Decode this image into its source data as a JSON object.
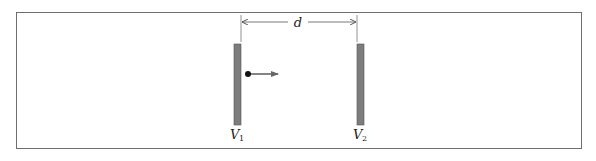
{
  "figure": {
    "dimension_label": "d",
    "plates": [
      {
        "name": "left-plate",
        "label": "V",
        "subscript": "1"
      },
      {
        "name": "right-plate",
        "label": "V",
        "subscript": "2"
      }
    ],
    "particle": {
      "direction": "right"
    },
    "colors": {
      "plate_fill": "#7d7d7d",
      "plate_stroke": "#555555",
      "frame": "#6e6e6e",
      "arrow": "#666666",
      "particle": "#111111",
      "dimension_line": "#555555"
    }
  }
}
